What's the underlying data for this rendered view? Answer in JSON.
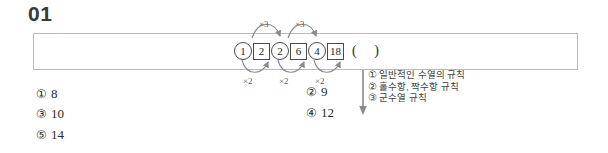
{
  "question": {
    "number": "01",
    "sequence": [
      {
        "style": "circled",
        "value": "1"
      },
      {
        "style": "boxed",
        "value": "2"
      },
      {
        "style": "circled",
        "value": "2"
      },
      {
        "style": "boxed",
        "value": "6"
      },
      {
        "style": "circled",
        "value": "4"
      },
      {
        "style": "boxed",
        "value": "18"
      }
    ],
    "blank": "(  )"
  },
  "operations": {
    "above": [
      {
        "label": "×3"
      },
      {
        "label": "×3"
      }
    ],
    "below": [
      {
        "label": "×2"
      },
      {
        "label": "×2"
      },
      {
        "label": "×2"
      }
    ]
  },
  "choices": [
    {
      "mark": "①",
      "value": "8"
    },
    {
      "mark": "②",
      "value": "9"
    },
    {
      "mark": "③",
      "value": "10"
    },
    {
      "mark": "④",
      "value": "12"
    },
    {
      "mark": "⑤",
      "value": "14"
    }
  ],
  "notes": [
    {
      "mark": "①",
      "text": "일반적인 수열의 규칙"
    },
    {
      "mark": "②",
      "text": "홀수항, 짝수항 규칙"
    },
    {
      "mark": "③",
      "text": "군수열 규칙"
    }
  ],
  "colors": {
    "box_border": "#b9b9b9",
    "text": "#2b2b2b",
    "arrow": "#808080",
    "note_text": "#3f3f3f"
  }
}
